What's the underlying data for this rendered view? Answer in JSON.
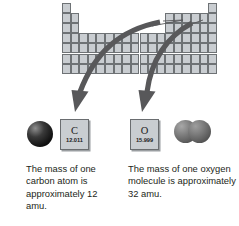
{
  "figure": {
    "background_color": "#ffffff"
  },
  "periodic_table": {
    "name": "periodic-table",
    "cell_fill_color": "#c9cdd1",
    "cell_border_color": "#6e7275",
    "columns": 18,
    "rows": 7,
    "description": "Simplified blank periodic table outline with main-group blocks"
  },
  "arrows": {
    "color": "#58585a",
    "carbon_arrow_label": "arrow pointing from periodic table to carbon element tile",
    "oxygen_arrow_label": "arrow pointing from periodic table to oxygen element tile"
  },
  "elements": [
    {
      "name": "carbon",
      "symbol": "C",
      "atomic_mass": "12.011",
      "tile_fill_color": "#c9cdd1"
    },
    {
      "name": "oxygen",
      "symbol": "O",
      "atomic_mass": "15.999",
      "tile_fill_color": "#c9cdd1"
    }
  ],
  "models": {
    "carbon_atom": {
      "name": "carbon-atom-model",
      "spheres": 1,
      "color": "#111111"
    },
    "oxygen_molecule": {
      "name": "oxygen-molecule-model",
      "spheres": 2,
      "color": "#6e6e6e"
    }
  },
  "captions": {
    "carbon": "The mass of one carbon atom is approximately 12 amu.",
    "oxygen": "The mass of one oxygen molecule is approximately 32 amu."
  }
}
